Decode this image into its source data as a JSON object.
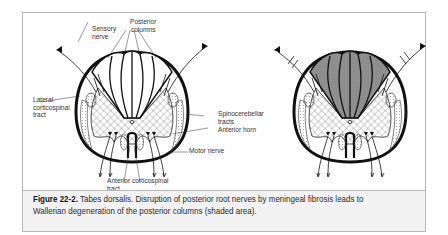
{
  "figure": {
    "number": "Figure 22-2.",
    "caption": " Tabes dorsalis. Disruption of posterior root nerves by meningeal fibrosis leads to Wallerian degeneration of the posterior columns (shaded area).",
    "labels": {
      "sensory_nerve": "Sensory\nnerve",
      "posterior_columns": "Posterior\ncolumns",
      "lateral_corticospinal": "Lateral\ncorticospinal\ntract",
      "spinocerebellar": "Spinocerebellar\ntracts",
      "anterior_horn": "Anterior horn",
      "motor_nerve": "Motor nerve",
      "anterior_corticospinal": "Anterior corticospinal\ntract"
    },
    "panels": [
      {
        "name": "normal",
        "shaded": false
      },
      {
        "name": "tabes-dorsalis",
        "shaded": true
      }
    ],
    "colors": {
      "line": "#111111",
      "shade": "#8a8a8a",
      "caption_bg": "#f2f2f2",
      "frame": "#b8b8b8"
    }
  }
}
